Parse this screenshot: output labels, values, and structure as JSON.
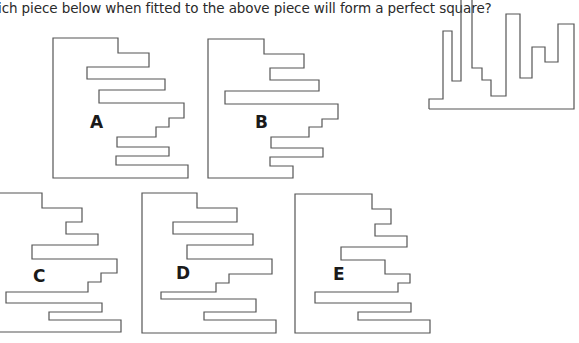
{
  "question": {
    "text": "ich piece below when fitted to the above piece will form a perfect square?"
  },
  "target_piece": {
    "name": "above piece"
  },
  "options": [
    {
      "label": "A"
    },
    {
      "label": "B"
    },
    {
      "label": "C"
    },
    {
      "label": "D"
    },
    {
      "label": "E"
    }
  ],
  "colors": {
    "outline": "#555555",
    "text": "#2a2a2a"
  }
}
